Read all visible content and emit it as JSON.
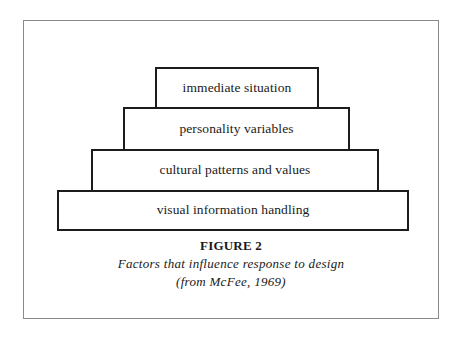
{
  "diagram": {
    "type": "stacked-pyramid",
    "tiers_top_to_bottom": [
      {
        "label": "immediate situation"
      },
      {
        "label": "personality variables"
      },
      {
        "label": "cultural patterns and values"
      },
      {
        "label": "visual information handling"
      }
    ]
  },
  "caption": {
    "figure_label": "FIGURE 2",
    "description": "Factors that influence response to design",
    "source": "(from McFee, 1969)"
  },
  "colors": {
    "frame_border": "#8a8a8a",
    "tier_border": "#1c1c1c",
    "background": "#ffffff",
    "text": "#1a1a1a"
  }
}
